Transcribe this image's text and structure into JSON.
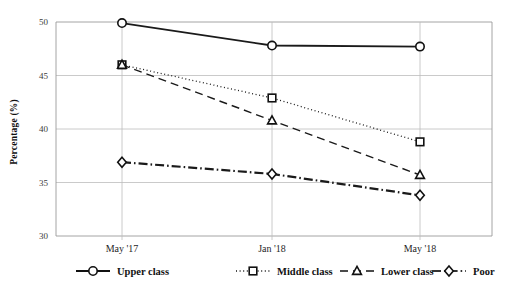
{
  "chart_data": {
    "type": "line",
    "title": "",
    "subtitle": "",
    "xlabel": "",
    "ylabel": "Percentage (%)",
    "categories": [
      "May '17",
      "Jan '18",
      "May '18"
    ],
    "ylim": [
      30,
      50
    ],
    "yticks": [
      30,
      35,
      40,
      45,
      50
    ],
    "ytick_labels": [
      "30",
      "35",
      "40",
      "45",
      "50"
    ],
    "grid": true,
    "legend_position": "bottom",
    "series": [
      {
        "name": "Upper class",
        "values": [
          49.9,
          47.8,
          47.7
        ],
        "marker": "circle",
        "line_style": "solid",
        "color": "#111111"
      },
      {
        "name": "Middle class",
        "values": [
          46.0,
          42.9,
          38.8
        ],
        "marker": "square",
        "line_style": "dotted",
        "color": "#111111"
      },
      {
        "name": "Lower class",
        "values": [
          46.0,
          40.8,
          35.7
        ],
        "marker": "triangle",
        "line_style": "dashed",
        "color": "#111111"
      },
      {
        "name": "Poor",
        "values": [
          36.9,
          35.8,
          33.8
        ],
        "marker": "diamond",
        "line_style": "dashdot",
        "color": "#333333"
      }
    ]
  },
  "axes": {
    "y_title": "Percentage (%)"
  },
  "legend": {
    "items": [
      {
        "label": "Upper class"
      },
      {
        "label": "Middle class"
      },
      {
        "label": "Lower class"
      },
      {
        "label": "Poor"
      }
    ]
  }
}
